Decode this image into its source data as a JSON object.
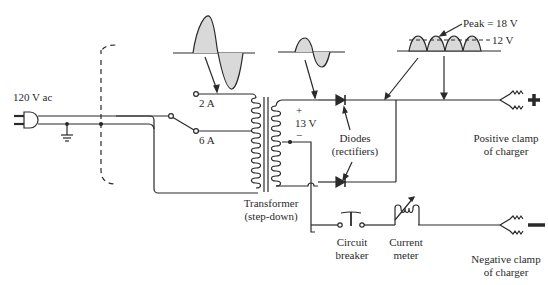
{
  "diagram": {
    "colors": {
      "line": "#2a2a2a",
      "fill": "#d9d9d9",
      "bg": "#ffffff"
    },
    "labels": {
      "source": "120 V ac",
      "tap_2a": "2 A",
      "tap_6a": "6 A",
      "secondary_plus": "+",
      "secondary_voltage": "13 V",
      "secondary_minus": "−",
      "diodes_line1": "Diodes",
      "diodes_line2": "(rectifiers)",
      "transformer_line1": "Transformer",
      "transformer_line2": "(step-down)",
      "breaker_line1": "Circuit",
      "breaker_line2": "breaker",
      "meter_line1": "Current",
      "meter_line2": "meter",
      "pos_clamp_line1": "Positive clamp",
      "pos_clamp_line2": "of charger",
      "neg_clamp_line1": "Negative clamp",
      "neg_clamp_line2": "of charger",
      "peak": "Peak = 18 V",
      "avg": "12 V"
    },
    "components": [
      "ac-plug",
      "ground",
      "selector-switch",
      "step-down-transformer",
      "diode-top",
      "diode-bottom",
      "circuit-breaker",
      "current-meter",
      "positive-clamp",
      "negative-clamp"
    ],
    "waveforms": [
      {
        "name": "primary-sine",
        "type": "sine",
        "cycles": 1
      },
      {
        "name": "secondary-sine",
        "type": "sine",
        "cycles": 1
      },
      {
        "name": "rectified-output",
        "type": "full-wave-rectified",
        "humps": 4,
        "peak_v": 18,
        "avg_v": 12
      }
    ]
  }
}
